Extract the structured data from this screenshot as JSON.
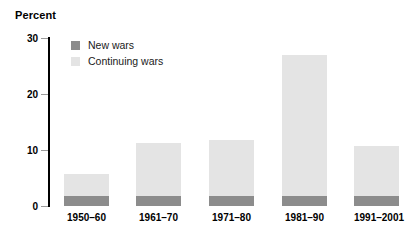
{
  "chart_data": {
    "type": "bar",
    "subtype": "stacked-vertical",
    "title": "",
    "subtitle": "",
    "xlabel": "",
    "ylabel": "Percent",
    "ylim": [
      0,
      30
    ],
    "yticks": [
      0,
      10,
      20,
      30
    ],
    "ytick_labels": [
      "0",
      "10",
      "20",
      "30"
    ],
    "grid": false,
    "legend_position": "top-left-inside",
    "categories": [
      "1950–60",
      "1961–70",
      "1971–80",
      "1981–90",
      "1991–2001"
    ],
    "series": [
      {
        "name": "New wars",
        "color": "#8c8c8c",
        "values": [
          1.7,
          1.7,
          1.7,
          1.7,
          1.7
        ]
      },
      {
        "name": "Continuing wars",
        "color": "#e4e4e4",
        "values": [
          4.0,
          9.5,
          10.1,
          25.3,
          9.0
        ]
      }
    ],
    "totals": [
      5.7,
      11.2,
      11.8,
      27.0,
      10.7
    ]
  },
  "axis": {
    "y_title": "Percent",
    "ticks": [
      {
        "label": "30",
        "value": 30
      },
      {
        "label": "20",
        "value": 20
      },
      {
        "label": "10",
        "value": 10
      },
      {
        "label": "0",
        "value": 0
      }
    ]
  },
  "legend": {
    "items": [
      {
        "label": "New wars",
        "color": "#8c8c8c"
      },
      {
        "label": "Continuing wars",
        "color": "#e4e4e4"
      }
    ]
  },
  "colors": {
    "new_wars": "#8c8c8c",
    "continuing_wars": "#e4e4e4",
    "axis": "#000000",
    "tick": "#9a9a9a",
    "background": "#ffffff",
    "text": "#000000"
  }
}
